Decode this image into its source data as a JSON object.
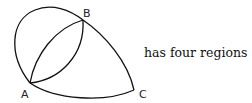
{
  "diagram": {
    "points": [
      {
        "label": "A",
        "x": 30,
        "y": 83
      },
      {
        "label": "B",
        "x": 83,
        "y": 20
      },
      {
        "label": "C",
        "x": 134,
        "y": 90
      }
    ],
    "caption": "has four regions",
    "stroke_color": "#111111"
  }
}
